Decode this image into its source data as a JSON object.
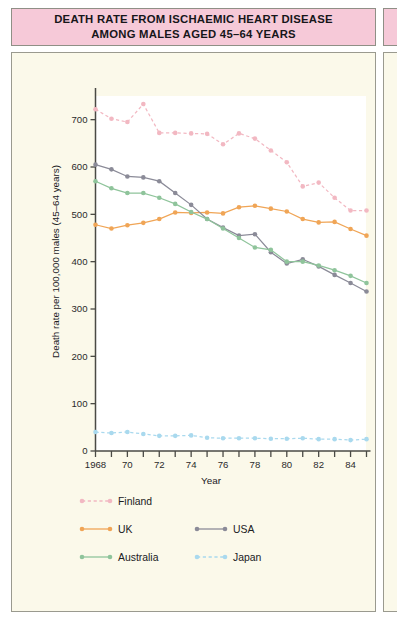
{
  "title": {
    "line1": "DEATH RATE FROM ISCHAEMIC HEART DISEASE",
    "line2": "AMONG MALES AGED 45–64 YEARS",
    "banner_color": "#f6c9d8"
  },
  "panel": {
    "background_color": "#fbf9ea",
    "border_color": "#9a9a8f",
    "plot_background_color": "#ffffff"
  },
  "axes": {
    "y_title": "Death rate per 100,000 males (45–64 years)",
    "x_title": "Year",
    "y_ticks": [
      "0",
      "100",
      "200",
      "300",
      "400",
      "500",
      "600",
      "700"
    ],
    "x_ticks": [
      "1968",
      "",
      "70",
      "",
      "72",
      "",
      "74",
      "",
      "76",
      "",
      "78",
      "",
      "80",
      "",
      "82",
      "",
      "84",
      ""
    ],
    "x_tick_labels_shown": [
      "1968",
      "70",
      "72",
      "74",
      "76",
      "78",
      "80",
      "82",
      "84"
    ]
  },
  "legend": {
    "items": [
      {
        "label": "Finland",
        "color": "#f2b8c2",
        "style": "dashed"
      },
      {
        "label": "UK",
        "color": "#f0a556",
        "style": "solid"
      },
      {
        "label": "USA",
        "color": "#8b8b98",
        "style": "solid"
      },
      {
        "label": "Australia",
        "color": "#8fc49b",
        "style": "solid"
      },
      {
        "label": "Japan",
        "color": "#a9d9ee",
        "style": "dashed"
      }
    ]
  },
  "chart_data": {
    "type": "line",
    "title": "DEATH RATE FROM ISCHAEMIC HEART DISEASE AMONG MALES AGED 45–64 YEARS",
    "xlabel": "Year",
    "ylabel": "Death rate per 100,000 males (45–64 years)",
    "xlim": [
      1968,
      1985
    ],
    "ylim": [
      0,
      750
    ],
    "yticks": [
      0,
      100,
      200,
      300,
      400,
      500,
      600,
      700
    ],
    "xticks": [
      1968,
      1969,
      1970,
      1971,
      1972,
      1973,
      1974,
      1975,
      1976,
      1977,
      1978,
      1979,
      1980,
      1981,
      1982,
      1983,
      1984,
      1985
    ],
    "grid": false,
    "legend_position": "below-plot",
    "x": [
      1968,
      1969,
      1970,
      1971,
      1972,
      1973,
      1974,
      1975,
      1976,
      1977,
      1978,
      1979,
      1980,
      1981,
      1982,
      1983,
      1984,
      1985
    ],
    "series": [
      {
        "name": "Finland",
        "color": "#f2b8c2",
        "style": "dashed",
        "values": [
          722,
          702,
          695,
          733,
          672,
          672,
          671,
          670,
          648,
          671,
          660,
          635,
          610,
          559,
          567,
          535,
          508,
          508
        ]
      },
      {
        "name": "UK",
        "color": "#f0a556",
        "style": "solid",
        "values": [
          478,
          470,
          477,
          482,
          490,
          504,
          503,
          504,
          502,
          515,
          518,
          512,
          506,
          490,
          483,
          484,
          469,
          455
        ]
      },
      {
        "name": "USA",
        "color": "#8b8b98",
        "style": "solid",
        "values": [
          605,
          595,
          580,
          578,
          570,
          545,
          520,
          490,
          472,
          455,
          458,
          420,
          396,
          405,
          390,
          372,
          355,
          337
        ]
      },
      {
        "name": "Australia",
        "color": "#8fc49b",
        "style": "solid",
        "values": [
          570,
          555,
          545,
          545,
          535,
          522,
          505,
          490,
          470,
          450,
          430,
          425,
          400,
          400,
          392,
          382,
          370,
          355
        ]
      },
      {
        "name": "Japan",
        "color": "#a9d9ee",
        "style": "dashed",
        "values": [
          40,
          38,
          40,
          36,
          32,
          32,
          33,
          28,
          27,
          27,
          27,
          26,
          26,
          27,
          25,
          25,
          23,
          25
        ]
      }
    ]
  }
}
